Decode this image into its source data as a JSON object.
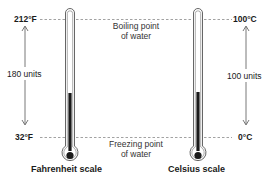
{
  "diagram": {
    "reference_lines": {
      "boiling": {
        "label_line1": "Boiling point",
        "label_line2": "of water"
      },
      "freezing": {
        "label_line1": "Freezing point",
        "label_line2": "of water"
      }
    },
    "fahrenheit": {
      "scale_label": "Fahrenheit scale",
      "top_value": "212°F",
      "bottom_value": "32°F",
      "span_label": "180 units"
    },
    "celsius": {
      "scale_label": "Celsius scale",
      "top_value": "100°C",
      "bottom_value": "0°C",
      "span_label": "100 units"
    },
    "colors": {
      "line": "#555555",
      "mercury": "#1a1a1a",
      "dash": "#888888",
      "text": "#1a1a1a"
    }
  }
}
